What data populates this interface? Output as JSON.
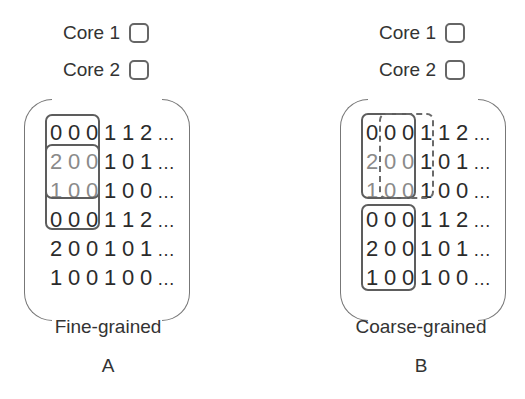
{
  "legend": {
    "core1_label": "Core 1",
    "core2_label": "Core 2"
  },
  "matrix_rows": [
    [
      "0",
      "0",
      "0",
      "1",
      "1",
      "2"
    ],
    [
      "2",
      "0",
      "0",
      "1",
      "0",
      "1"
    ],
    [
      "1",
      "0",
      "0",
      "1",
      "0",
      "0"
    ],
    [
      "0",
      "0",
      "0",
      "1",
      "1",
      "2"
    ],
    [
      "2",
      "0",
      "0",
      "1",
      "0",
      "1"
    ],
    [
      "1",
      "0",
      "0",
      "1",
      "0",
      "0"
    ]
  ],
  "ellipsis": "…",
  "panels": [
    {
      "id": "A",
      "caption": "Fine-grained",
      "letter": "A",
      "groups": [
        {
          "style": "solid",
          "rows": [
            0,
            2
          ],
          "cols": [
            0,
            2
          ]
        },
        {
          "style": "solid",
          "rows": [
            1,
            3
          ],
          "cols": [
            0,
            2
          ]
        }
      ]
    },
    {
      "id": "B",
      "caption": "Coarse-grained",
      "letter": "B",
      "groups": [
        {
          "style": "solid",
          "rows": [
            0,
            2
          ],
          "cols": [
            0,
            2
          ]
        },
        {
          "style": "dashed",
          "rows": [
            0,
            2
          ],
          "cols": [
            1,
            3
          ]
        },
        {
          "style": "solid",
          "rows": [
            3,
            5
          ],
          "cols": [
            0,
            2
          ]
        }
      ]
    }
  ],
  "colors": {
    "text": "#2b2b2b",
    "faded_text": "#8a8a8a",
    "box_stroke": "#5d5d5d",
    "bracket_stroke": "#777777"
  }
}
